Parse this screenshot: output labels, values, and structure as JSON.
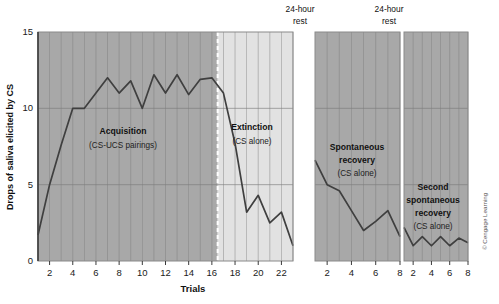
{
  "figure": {
    "credit": "© Cengage Learning",
    "background": "#ffffff",
    "line_color": "#3f3f3f",
    "panel_fill_dark": "#a8a8a8",
    "panel_fill_light": "#e2e2e2",
    "grid_color": "#7c7c7c"
  },
  "chart_data": {
    "type": "line",
    "title": "",
    "xlabel": "Trials",
    "ylabel": "Drops of saliva elicited by CS",
    "ylim": [
      0,
      15
    ],
    "yticks": [
      0,
      5,
      10,
      15
    ],
    "grid": true,
    "legend": "none",
    "panels": [
      {
        "name": "acquisition-extinction",
        "xlim": [
          1,
          23
        ],
        "xticks": [
          2,
          4,
          6,
          8,
          10,
          12,
          14,
          16,
          18,
          20,
          22
        ],
        "shading": [
          {
            "label": "Acquisition",
            "from": 1,
            "to": 16.5,
            "fill": "#a8a8a8"
          },
          {
            "label": "Extinction",
            "from": 16.5,
            "to": 23,
            "fill": "#e2e2e2"
          }
        ],
        "annotations": [
          {
            "title": "Acquisition",
            "subtitle": "(CS-UCS pairings)"
          },
          {
            "title": "Extinction",
            "subtitle": "(CS alone)"
          }
        ],
        "x": [
          1,
          2,
          3,
          4,
          5,
          6,
          7,
          8,
          9,
          10,
          11,
          12,
          13,
          14,
          15,
          16,
          17,
          18,
          19,
          20,
          21,
          22,
          23
        ],
        "values": [
          1.7,
          5.0,
          7.6,
          10.0,
          10.0,
          11.0,
          12.0,
          11.0,
          11.8,
          10.0,
          12.2,
          11.0,
          12.2,
          10.9,
          11.9,
          12.0,
          11.0,
          7.7,
          3.2,
          4.3,
          2.5,
          3.2,
          1.0
        ]
      },
      {
        "name": "spontaneous-recovery",
        "rest_label": "24-hour rest",
        "xlim": [
          1,
          8
        ],
        "xticks": [
          2,
          4,
          6,
          8
        ],
        "shading": [
          {
            "label": "Spontaneous recovery",
            "from": 1,
            "to": 8,
            "fill": "#a8a8a8"
          }
        ],
        "annotations": [
          {
            "title": "Spontaneous",
            "title2": "recovery",
            "subtitle": "(CS alone)"
          }
        ],
        "x": [
          1,
          2,
          3,
          4,
          5,
          6,
          7,
          8
        ],
        "values": [
          6.6,
          5.0,
          4.6,
          3.3,
          2.0,
          2.6,
          3.3,
          1.6
        ]
      },
      {
        "name": "second-spontaneous-recovery",
        "rest_label": "24-hour rest",
        "xlim": [
          1,
          8
        ],
        "xticks": [
          2,
          4,
          6,
          8
        ],
        "shading": [
          {
            "label": "Second spontaneous recovery",
            "from": 1,
            "to": 8,
            "fill": "#a8a8a8"
          }
        ],
        "annotations": [
          {
            "title": "Second",
            "title2": "spontaneous",
            "title3": "recovery",
            "subtitle": "(CS alone)"
          }
        ],
        "x": [
          1,
          2,
          3,
          4,
          5,
          6,
          7,
          8
        ],
        "values": [
          2.2,
          1.0,
          1.6,
          1.0,
          1.6,
          1.0,
          1.5,
          1.2
        ]
      }
    ]
  },
  "labels": {
    "ylabel": "Drops of saliva elicited by CS",
    "xlabel": "Trials",
    "ytick_0": "0",
    "ytick_5": "5",
    "ytick_10": "10",
    "ytick_15": "15",
    "rest_1_line1": "24-hour",
    "rest_1_line2": "rest",
    "rest_2_line1": "24-hour",
    "rest_2_line2": "rest",
    "acq_title": "Acquisition",
    "acq_sub": "(CS-UCS pairings)",
    "ext_title": "Extinction",
    "ext_sub": "(CS alone)",
    "sr_title_1": "Spontaneous",
    "sr_title_2": "recovery",
    "sr_sub": "(CS alone)",
    "ssr_title_1": "Second",
    "ssr_title_2": "spontaneous",
    "ssr_title_3": "recovery",
    "ssr_sub": "(CS alone)",
    "credit": "© Cengage Learning",
    "p1_ticks": [
      "2",
      "4",
      "6",
      "8",
      "10",
      "12",
      "14",
      "16",
      "18",
      "20",
      "22"
    ],
    "p2_ticks": [
      "2",
      "4",
      "6",
      "8"
    ],
    "p3_ticks": [
      "2",
      "4",
      "6",
      "8"
    ]
  }
}
